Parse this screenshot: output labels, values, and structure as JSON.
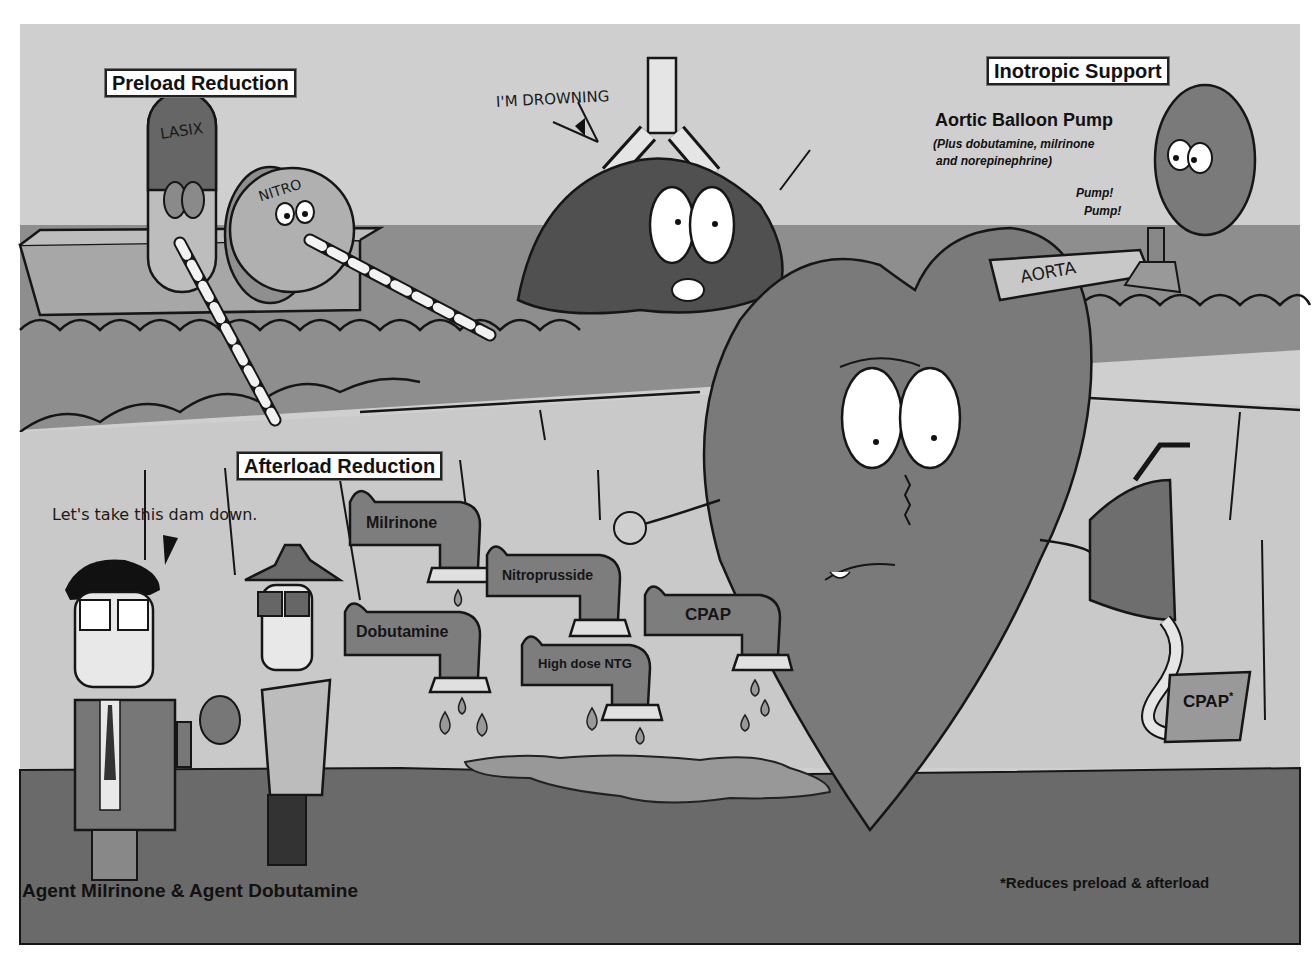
{
  "section_labels": {
    "preload": "Preload Reduction",
    "afterload": "Afterload Reduction",
    "inotropic": "Inotropic Support"
  },
  "inotropic": {
    "title": "Aortic Balloon Pump",
    "subtitle_line1": "(Plus dobutamine, milrinone",
    "subtitle_line2": "and norepinephrine)",
    "pump1": "Pump!",
    "pump2": "Pump!"
  },
  "characters": {
    "lasix_label": "LASIX",
    "nitro_label": "NITRO",
    "lung_speech": "I'M DROWNING",
    "aorta_label": "AORTA",
    "agent_speech": "Let's take this dam down."
  },
  "faucets": [
    {
      "label": "Milrinone"
    },
    {
      "label": "Nitroprusside"
    },
    {
      "label": "Dobutamine"
    },
    {
      "label": "High dose NTG"
    },
    {
      "label": "CPAP"
    }
  ],
  "cpap_box": {
    "label": "CPAP",
    "mark": "*"
  },
  "captions": {
    "agents": "Agent Milrinone & Agent Dobutamine",
    "footnote": "*Reduces preload & afterload"
  },
  "colors": {
    "sky": "#cfcfcf",
    "water": "#8e8e8e",
    "wall": "#c9c9c9",
    "ground": "#6a6a6a",
    "heart": "#7a7a7a",
    "lung": "#505050",
    "outline": "#161616"
  }
}
